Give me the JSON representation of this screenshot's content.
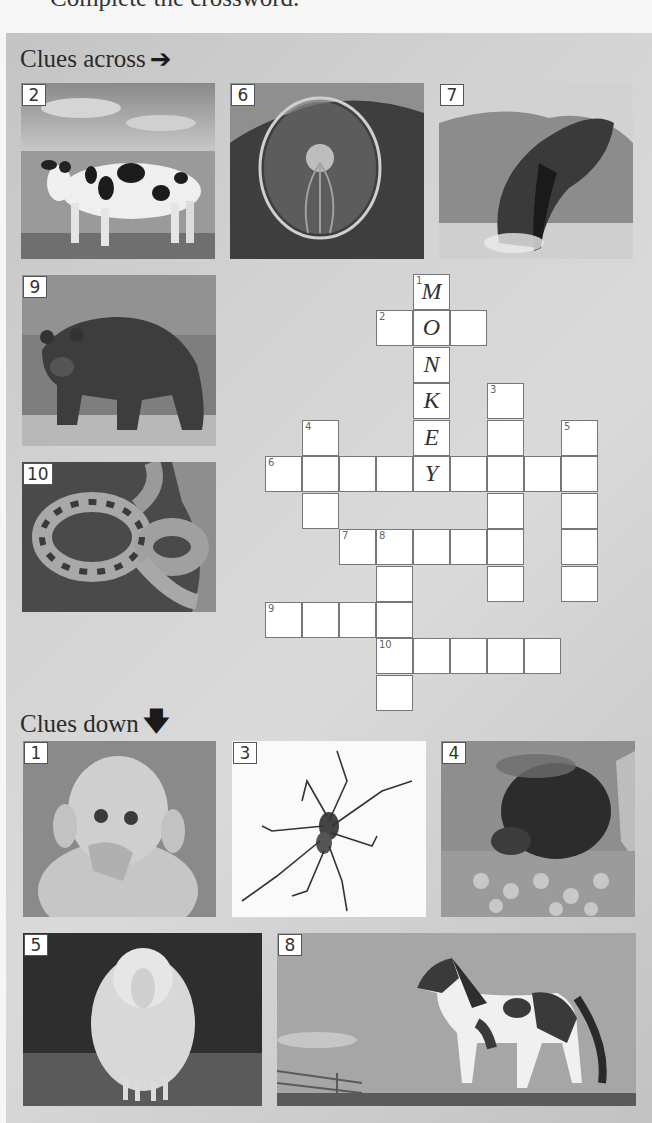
{
  "page": {
    "instruction": "Complete the crossword."
  },
  "across": {
    "heading": "Clues across",
    "arrow_icon": "arrow-right-icon",
    "clues": [
      {
        "number": "2",
        "picture": "cow"
      },
      {
        "number": "6",
        "picture": "jellyfish"
      },
      {
        "number": "7",
        "picture": "whale"
      },
      {
        "number": "9",
        "picture": "bear"
      },
      {
        "number": "10",
        "picture": "snake"
      }
    ]
  },
  "down": {
    "heading": "Clues down",
    "arrow_icon": "arrow-down-icon",
    "clues": [
      {
        "number": "1",
        "picture": "monkey"
      },
      {
        "number": "3",
        "picture": "spider"
      },
      {
        "number": "4",
        "picture": "bee"
      },
      {
        "number": "5",
        "picture": "sheep"
      },
      {
        "number": "8",
        "picture": "horse"
      }
    ]
  },
  "crossword": {
    "cell_size": 37,
    "origin": {
      "x": 265,
      "y": 274
    },
    "cells": [
      {
        "r": 0,
        "c": 4,
        "num": "1",
        "letter": "M"
      },
      {
        "r": 1,
        "c": 3,
        "num": "2",
        "letter": ""
      },
      {
        "r": 1,
        "c": 4,
        "num": "",
        "letter": "O"
      },
      {
        "r": 1,
        "c": 5,
        "num": "",
        "letter": ""
      },
      {
        "r": 2,
        "c": 4,
        "num": "",
        "letter": "N"
      },
      {
        "r": 3,
        "c": 4,
        "num": "",
        "letter": "K"
      },
      {
        "r": 3,
        "c": 6,
        "num": "3",
        "letter": ""
      },
      {
        "r": 4,
        "c": 1,
        "num": "4",
        "letter": ""
      },
      {
        "r": 4,
        "c": 4,
        "num": "",
        "letter": "E"
      },
      {
        "r": 4,
        "c": 6,
        "num": "",
        "letter": ""
      },
      {
        "r": 4,
        "c": 8,
        "num": "5",
        "letter": ""
      },
      {
        "r": 5,
        "c": 0,
        "num": "6",
        "letter": ""
      },
      {
        "r": 5,
        "c": 1,
        "num": "",
        "letter": ""
      },
      {
        "r": 5,
        "c": 2,
        "num": "",
        "letter": ""
      },
      {
        "r": 5,
        "c": 3,
        "num": "",
        "letter": ""
      },
      {
        "r": 5,
        "c": 4,
        "num": "",
        "letter": "Y"
      },
      {
        "r": 5,
        "c": 5,
        "num": "",
        "letter": ""
      },
      {
        "r": 5,
        "c": 6,
        "num": "",
        "letter": ""
      },
      {
        "r": 5,
        "c": 7,
        "num": "",
        "letter": ""
      },
      {
        "r": 5,
        "c": 8,
        "num": "",
        "letter": ""
      },
      {
        "r": 6,
        "c": 1,
        "num": "",
        "letter": ""
      },
      {
        "r": 6,
        "c": 6,
        "num": "",
        "letter": ""
      },
      {
        "r": 6,
        "c": 8,
        "num": "",
        "letter": ""
      },
      {
        "r": 7,
        "c": 2,
        "num": "7",
        "letter": ""
      },
      {
        "r": 7,
        "c": 3,
        "num": "8",
        "letter": ""
      },
      {
        "r": 7,
        "c": 4,
        "num": "",
        "letter": ""
      },
      {
        "r": 7,
        "c": 5,
        "num": "",
        "letter": ""
      },
      {
        "r": 7,
        "c": 6,
        "num": "",
        "letter": ""
      },
      {
        "r": 7,
        "c": 8,
        "num": "",
        "letter": ""
      },
      {
        "r": 8,
        "c": 3,
        "num": "",
        "letter": ""
      },
      {
        "r": 8,
        "c": 6,
        "num": "",
        "letter": ""
      },
      {
        "r": 8,
        "c": 8,
        "num": "",
        "letter": ""
      },
      {
        "r": 9,
        "c": 0,
        "num": "9",
        "letter": ""
      },
      {
        "r": 9,
        "c": 1,
        "num": "",
        "letter": ""
      },
      {
        "r": 9,
        "c": 2,
        "num": "",
        "letter": ""
      },
      {
        "r": 9,
        "c": 3,
        "num": "",
        "letter": ""
      },
      {
        "r": 10,
        "c": 3,
        "num": "10",
        "letter": ""
      },
      {
        "r": 10,
        "c": 4,
        "num": "",
        "letter": ""
      },
      {
        "r": 10,
        "c": 5,
        "num": "",
        "letter": ""
      },
      {
        "r": 10,
        "c": 6,
        "num": "",
        "letter": ""
      },
      {
        "r": 10,
        "c": 7,
        "num": "",
        "letter": ""
      },
      {
        "r": 11,
        "c": 3,
        "num": "",
        "letter": ""
      }
    ]
  }
}
